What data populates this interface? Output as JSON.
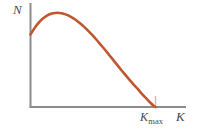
{
  "figure": {
    "background_color": "#ffffff",
    "axis_color": "#8c8c8c",
    "label_color": "#4a4a4a",
    "curve_color": "#c0562e",
    "tick_color": "#d8b8b0"
  },
  "labels": {
    "y_axis": "N",
    "x_axis": "K",
    "kmax_base": "K",
    "kmax_sub": "max"
  },
  "chart_data": {
    "type": "line",
    "title": "",
    "subtitle": "",
    "xlabel": "K",
    "ylabel": "N",
    "legend": [],
    "grid": false,
    "legend_position": "none",
    "xlim": [
      0,
      1.22
    ],
    "ylim": [
      0,
      1.1
    ],
    "tick_labels": {
      "x": [
        "K_max"
      ],
      "y": []
    },
    "annotations": [
      {
        "text": "K_max",
        "x": 1.0,
        "y": 0,
        "note": "tick marking the value of K at which N falls to zero"
      }
    ],
    "series": [
      {
        "name": "N(K)",
        "color": "#c0562e",
        "x": [
          0.0,
          0.033,
          0.066,
          0.099,
          0.132,
          0.165,
          0.198,
          0.231,
          0.264,
          0.297,
          0.33,
          0.363,
          0.396,
          0.429,
          0.462,
          0.495,
          0.528,
          0.561,
          0.594,
          0.627,
          0.66,
          0.693,
          0.726,
          0.759,
          0.792,
          0.825,
          0.858,
          0.891,
          0.924,
          0.957,
          0.99,
          1.0
        ],
        "y": [
          0.74,
          0.806,
          0.86,
          0.902,
          0.932,
          0.951,
          0.96,
          0.96,
          0.952,
          0.937,
          0.915,
          0.888,
          0.855,
          0.818,
          0.777,
          0.733,
          0.686,
          0.637,
          0.587,
          0.535,
          0.483,
          0.43,
          0.378,
          0.327,
          0.277,
          0.229,
          0.184,
          0.134,
          0.09,
          0.046,
          0.008,
          0.0
        ]
      }
    ]
  }
}
